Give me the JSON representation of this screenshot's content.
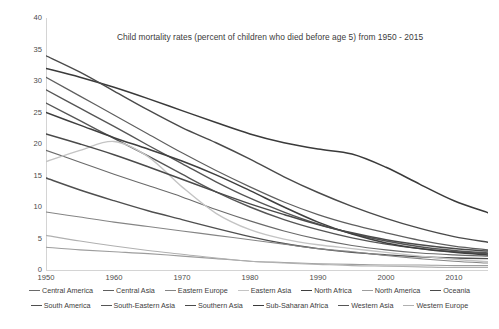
{
  "chart_data": {
    "type": "line",
    "title": "Child mortality rates (percent of children who died before age 5) from 1950 - 2015",
    "xlabel": "",
    "ylabel": "",
    "xlim": [
      1950,
      2015
    ],
    "ylim": [
      0,
      40
    ],
    "grid": false,
    "legend_position": "bottom",
    "x_ticks": [
      "1950",
      "1960",
      "1970",
      "1980",
      "1990",
      "2000",
      "2010"
    ],
    "y_ticks": [
      "0",
      "5",
      "10",
      "15",
      "20",
      "25",
      "30",
      "35",
      "40"
    ],
    "x": [
      1950,
      1955,
      1960,
      1965,
      1970,
      1975,
      1980,
      1985,
      1990,
      1995,
      2000,
      2005,
      2010,
      2015
    ],
    "series": [
      {
        "name": "Sub-Saharan Africa",
        "color": "#3a3a3a",
        "width": 1.5,
        "values": [
          32.0,
          30.6,
          29.0,
          27.2,
          25.3,
          23.4,
          21.6,
          20.2,
          19.2,
          18.4,
          16.3,
          13.6,
          11.0,
          9.1
        ]
      },
      {
        "name": "Southern Asia",
        "color": "#4a4a4a",
        "width": 1.4,
        "values": [
          34.0,
          31.4,
          28.4,
          25.4,
          22.6,
          20.2,
          17.6,
          14.8,
          12.3,
          10.1,
          8.2,
          6.6,
          5.3,
          4.4
        ]
      },
      {
        "name": "South-Eastern Asia",
        "color": "#555555",
        "width": 1.4,
        "values": [
          26.5,
          23.7,
          20.9,
          18.1,
          15.2,
          12.4,
          10.0,
          8.0,
          6.4,
          5.1,
          4.1,
          3.4,
          2.9,
          2.6
        ]
      },
      {
        "name": "Western Asia",
        "color": "#555555",
        "width": 1.4,
        "values": [
          28.6,
          25.7,
          22.8,
          19.8,
          16.9,
          14.0,
          11.4,
          9.2,
          7.3,
          5.8,
          4.6,
          3.7,
          3.1,
          2.7
        ]
      },
      {
        "name": "South America",
        "color": "#4f4f4f",
        "width": 1.4,
        "values": [
          14.6,
          12.7,
          11.0,
          9.4,
          8.0,
          6.6,
          5.3,
          4.2,
          3.4,
          2.8,
          2.4,
          2.1,
          1.9,
          1.8
        ]
      },
      {
        "name": "Central America",
        "color": "#6a6a6a",
        "width": 1.1,
        "values": [
          19.0,
          17.1,
          15.2,
          13.4,
          11.6,
          9.6,
          7.8,
          6.2,
          4.9,
          3.9,
          3.2,
          2.7,
          2.4,
          2.2
        ]
      },
      {
        "name": "Central Asia",
        "color": "#5f5f5f",
        "width": 1.2,
        "values": [
          30.6,
          27.6,
          24.6,
          21.6,
          18.6,
          15.8,
          13.2,
          10.8,
          8.8,
          7.2,
          5.9,
          4.7,
          3.8,
          3.2
        ]
      },
      {
        "name": "North Africa",
        "color": "#3f3f3f",
        "width": 1.5,
        "values": [
          25.0,
          23.0,
          21.0,
          19.2,
          17.3,
          15.1,
          12.6,
          10.0,
          7.6,
          5.7,
          4.3,
          3.4,
          2.8,
          2.4
        ]
      },
      {
        "name": "Eastern Europe",
        "color": "#858585",
        "width": 1.1,
        "values": [
          9.2,
          8.4,
          7.6,
          6.9,
          6.2,
          5.5,
          4.8,
          4.1,
          3.4,
          2.9,
          2.3,
          1.8,
          1.4,
          1.1
        ]
      },
      {
        "name": "Eastern Asia",
        "color": "#c4c4c4",
        "width": 1.4,
        "values": [
          17.2,
          19.0,
          20.4,
          18.0,
          13.2,
          9.0,
          6.4,
          4.9,
          4.0,
          3.4,
          2.8,
          2.2,
          1.7,
          1.3
        ]
      },
      {
        "name": "Oceania",
        "color": "#4a4a4a",
        "width": 1.5,
        "values": [
          21.6,
          20.0,
          18.3,
          16.4,
          14.4,
          12.4,
          10.5,
          8.8,
          7.2,
          5.9,
          4.8,
          4.0,
          3.4,
          3.0
        ]
      },
      {
        "name": "North America",
        "color": "#9d9d9d",
        "width": 1.1,
        "values": [
          3.6,
          3.2,
          2.9,
          2.6,
          2.2,
          1.8,
          1.4,
          1.2,
          1.0,
          0.9,
          0.8,
          0.8,
          0.7,
          0.7
        ]
      },
      {
        "name": "Western Europe",
        "color": "#b0b0b0",
        "width": 1.1,
        "values": [
          5.5,
          4.6,
          3.8,
          3.1,
          2.5,
          1.9,
          1.4,
          1.1,
          0.9,
          0.7,
          0.6,
          0.5,
          0.4,
          0.4
        ]
      }
    ]
  },
  "legend": {
    "rows": [
      [
        {
          "label": "Central America",
          "color": "#6a6a6a",
          "width": 1.1
        },
        {
          "label": "Central Asia",
          "color": "#5f5f5f",
          "width": 1.2
        },
        {
          "label": "Eastern Europe",
          "color": "#858585",
          "width": 1.1
        },
        {
          "label": "Eastern Asia",
          "color": "#c4c4c4",
          "width": 1.4
        },
        {
          "label": "North Africa",
          "color": "#3f3f3f",
          "width": 1.5
        },
        {
          "label": "North America",
          "color": "#9d9d9d",
          "width": 1.1
        },
        {
          "label": "Oceania",
          "color": "#4a4a4a",
          "width": 1.5
        }
      ],
      [
        {
          "label": "South America",
          "color": "#4f4f4f",
          "width": 1.4
        },
        {
          "label": "South-Eastern Asia",
          "color": "#555555",
          "width": 1.4
        },
        {
          "label": "Southern Asia",
          "color": "#4a4a4a",
          "width": 1.4
        },
        {
          "label": "Sub-Saharan Africa",
          "color": "#3a3a3a",
          "width": 1.5
        },
        {
          "label": "Western Asia",
          "color": "#555555",
          "width": 1.4
        },
        {
          "label": "Western Europe",
          "color": "#b0b0b0",
          "width": 1.1
        }
      ]
    ]
  }
}
